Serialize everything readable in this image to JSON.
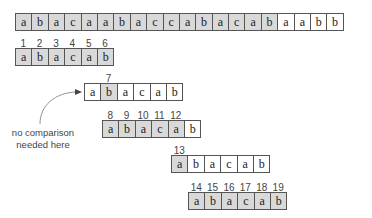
{
  "text_row": {
    "chars": [
      "a",
      "b",
      "a",
      "c",
      "a",
      "a",
      "b",
      "a",
      "c",
      "c",
      "a",
      "b",
      "a",
      "c",
      "a",
      "b",
      "a",
      "a",
      "b",
      "b"
    ],
    "highlight": [
      1,
      1,
      1,
      1,
      1,
      1,
      1,
      1,
      1,
      1,
      1,
      1,
      1,
      1,
      1,
      1,
      0,
      0,
      0,
      0
    ]
  },
  "pattern_rows": [
    {
      "chars": [
        "a",
        "b",
        "a",
        "c",
        "a",
        "b"
      ],
      "highlight": [
        1,
        1,
        1,
        1,
        1,
        1
      ],
      "labels": [
        "1",
        "2",
        "3",
        "4",
        "5",
        "6"
      ]
    },
    {
      "chars": [
        "a",
        "b",
        "a",
        "c",
        "a",
        "b"
      ],
      "highlight": [
        0,
        1,
        0,
        0,
        0,
        0
      ],
      "labels": [
        "",
        "7",
        "",
        "",
        "",
        ""
      ]
    },
    {
      "chars": [
        "a",
        "b",
        "a",
        "c",
        "a",
        "b"
      ],
      "highlight": [
        1,
        1,
        1,
        1,
        1,
        0
      ],
      "labels": [
        "8",
        "9",
        "10",
        "11",
        "12",
        ""
      ]
    },
    {
      "chars": [
        "a",
        "b",
        "a",
        "c",
        "a",
        "b"
      ],
      "highlight": [
        1,
        0,
        0,
        0,
        0,
        0
      ],
      "labels": [
        "13",
        "",
        "",
        "",
        "",
        ""
      ]
    },
    {
      "chars": [
        "a",
        "b",
        "a",
        "c",
        "a",
        "b"
      ],
      "highlight": [
        1,
        1,
        1,
        1,
        1,
        1
      ],
      "labels": [
        "14",
        "15",
        "16",
        "17",
        "18",
        "19"
      ]
    }
  ],
  "annotation": {
    "line1": "no comparison",
    "line2": "needed here"
  },
  "colors": {
    "highlight": "#d9d9d9",
    "border": "#555555"
  }
}
